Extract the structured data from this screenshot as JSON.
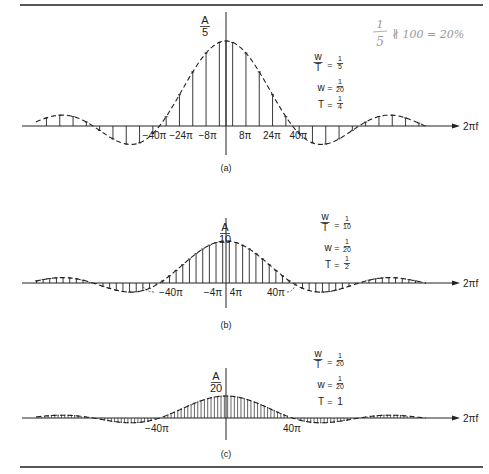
{
  "handwritten_note": {
    "frac_num": "1",
    "frac_den": "5",
    "text": "∦ 100 = 20%"
  },
  "chart_data": [
    {
      "type": "line",
      "panel": "(a)",
      "title": "(a)",
      "xlabel": "2πf",
      "ylabel_num": "A",
      "ylabel_den": "5",
      "peak": 0.2,
      "params": [
        {
          "lhs_num": "w",
          "lhs_den": "T",
          "rhs_num": "1",
          "rhs_den": "5"
        },
        {
          "lhs": "w",
          "rhs_num": "1",
          "rhs_den": "20"
        },
        {
          "lhs": "T",
          "rhs_num": "1",
          "rhs_den": "4"
        }
      ],
      "tick_labels": [
        "−40π",
        "−24π",
        "−8π",
        "8π",
        "24π",
        "40π"
      ],
      "line_spacing_pi": 8,
      "zero_crossings_pi": [
        -40,
        40,
        -80,
        80,
        -120,
        120
      ],
      "envelope": "sinc, dashed"
    },
    {
      "type": "line",
      "panel": "(b)",
      "title": "(b)",
      "xlabel": "2πf",
      "ylabel_num": "A",
      "ylabel_den": "10",
      "peak": 0.1,
      "params": [
        {
          "lhs_num": "w",
          "lhs_den": "T",
          "rhs_num": "1",
          "rhs_den": "10"
        },
        {
          "lhs": "w",
          "rhs_num": "1",
          "rhs_den": "20"
        },
        {
          "lhs": "T",
          "rhs_num": "1",
          "rhs_den": "2"
        }
      ],
      "tick_labels": [
        "−40π",
        "−4π",
        "4π",
        "40π"
      ],
      "line_spacing_pi": 4,
      "zero_crossings_pi": [
        -40,
        40,
        -80,
        80,
        -120,
        120
      ],
      "envelope": "sinc, dashed"
    },
    {
      "type": "line",
      "panel": "(c)",
      "title": "(c)",
      "xlabel": "2πf",
      "ylabel_num": "A",
      "ylabel_den": "20",
      "peak": 0.05,
      "params": [
        {
          "lhs_num": "w",
          "lhs_den": "T",
          "rhs_num": "1",
          "rhs_den": "20"
        },
        {
          "lhs": "w",
          "rhs_num": "1",
          "rhs_den": "20"
        },
        {
          "lhs": "T",
          "rhs": "1"
        }
      ],
      "tick_labels": [
        "−40π",
        "40π"
      ],
      "line_spacing_pi": 2,
      "zero_crossings_pi": [
        -40,
        40,
        -80,
        80,
        -120,
        120
      ],
      "envelope": "sinc, dashed"
    }
  ]
}
